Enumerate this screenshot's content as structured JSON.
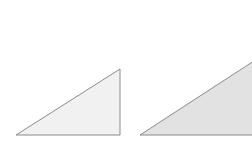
{
  "diagram": {
    "background": "#ffffff",
    "shapes": [
      {
        "name": "small-right-triangle",
        "points": "16,135 120,135 120,69",
        "fill": "#f1f1f1",
        "stroke": "#8a8a8a"
      },
      {
        "name": "large-right-triangle",
        "points": "140,135 260,135 260,57",
        "fill": "#e2e2e2",
        "stroke": "#8a8a8a"
      }
    ]
  }
}
